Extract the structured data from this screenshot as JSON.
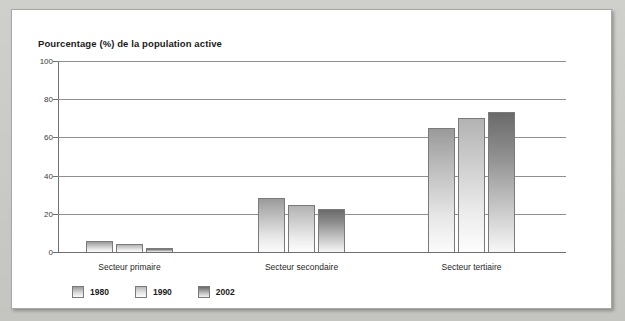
{
  "chart_data": {
    "type": "bar",
    "title": "Pourcentage (%) de la population active",
    "xlabel": "",
    "ylabel": "",
    "ylim": [
      0,
      100
    ],
    "yticks": [
      0,
      20,
      40,
      60,
      80,
      100
    ],
    "grid": true,
    "legend_position": "bottom-left",
    "categories": [
      "Secteur primaire",
      "Secteur secondaire",
      "Secteur tertiaire"
    ],
    "series": [
      {
        "name": "1980",
        "color": "#9a9a9a",
        "values": [
          6,
          28.5,
          65
        ]
      },
      {
        "name": "1990",
        "color": "#b3b3b3",
        "values": [
          4,
          24.5,
          70
        ]
      },
      {
        "name": "2002",
        "color": "#6a6a6a",
        "values": [
          2,
          22.5,
          73.5
        ]
      }
    ]
  },
  "chart": {
    "title": "Pourcentage (%) de la population active",
    "y_ticks": [
      {
        "label": "100",
        "value": 100
      },
      {
        "label": "80",
        "value": 80
      },
      {
        "label": "60",
        "value": 60
      },
      {
        "label": "40",
        "value": 40
      },
      {
        "label": "20",
        "value": 20
      },
      {
        "label": "0",
        "value": 0
      }
    ],
    "categories": [
      {
        "label": "Secteur primaire"
      },
      {
        "label": "Secteur secondaire"
      },
      {
        "label": "Secteur tertiaire"
      }
    ],
    "legend": [
      {
        "label": "1980"
      },
      {
        "label": "1990"
      },
      {
        "label": "2002"
      }
    ]
  }
}
